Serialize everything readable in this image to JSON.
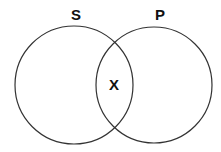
{
  "diagram": {
    "type": "venn",
    "sets": [
      {
        "label": "S",
        "cx": 74,
        "cy": 85,
        "r": 59
      },
      {
        "label": "P",
        "cx": 154,
        "cy": 85,
        "r": 58
      }
    ],
    "intersection_label": "X",
    "colors": {
      "stroke": "#333333",
      "fill": "none",
      "text": "#111111"
    }
  }
}
